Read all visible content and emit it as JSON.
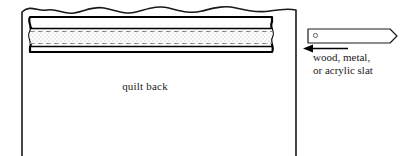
{
  "figure": {
    "type": "instructional-diagram",
    "background_color": "#ffffff",
    "line_color": "#1a1a1a"
  },
  "quilt": {
    "label": "quilt back",
    "top_edge_style": "wavy",
    "side_edge_style": "straight-vertical"
  },
  "sleeve": {
    "name": "hanging sleeve",
    "outline_color": "#000000",
    "fill_color": "#ffffff",
    "stipple_color": "#b8b8b8",
    "dashed_line_color": "#8a8a8a",
    "dashed_line_count": 2
  },
  "slat": {
    "name": "slat",
    "hole_icon": "circle-hole-icon",
    "end_style": "tapered",
    "outline_color": "#1a1a1a"
  },
  "callout": {
    "arrow_icon": "arrow-left-icon",
    "arrow_direction": "left",
    "caption_line_1": "wood, metal,",
    "caption_line_2": "or acrylic slat"
  }
}
